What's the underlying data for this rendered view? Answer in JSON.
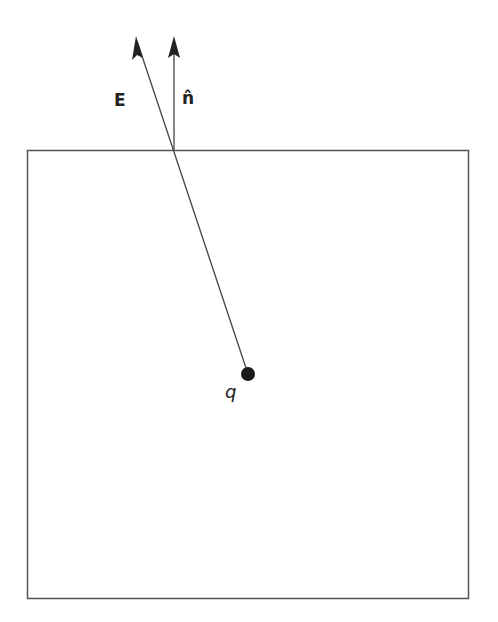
{
  "diagram": {
    "labels": {
      "field": "E",
      "normal": "n̂",
      "charge": "q"
    },
    "colors": {
      "line": "#555555",
      "arrow": "#222222",
      "charge": "#1a1a1a",
      "background": "#ffffff"
    },
    "surface_box": {
      "x": 27,
      "y": 150,
      "width": 441,
      "height": 448
    },
    "charge_point": {
      "x": 248,
      "y": 374,
      "r": 7
    },
    "field_vector": {
      "from": [
        248,
        374
      ],
      "to": [
        136,
        37
      ]
    },
    "normal_vector": {
      "from": [
        174,
        150
      ],
      "to": [
        174,
        37
      ]
    }
  }
}
